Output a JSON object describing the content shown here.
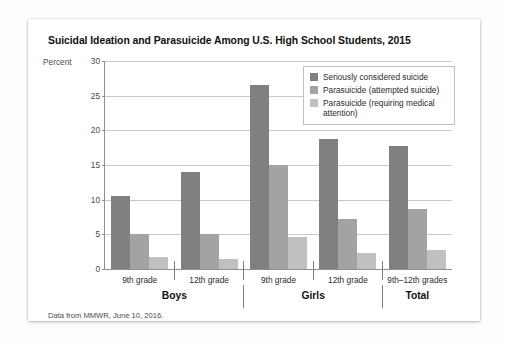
{
  "chart_data": {
    "type": "bar",
    "title": "Suicidal Ideation and Parasuicide Among U.S. High School Students, 2015",
    "ylabel": "Percent",
    "xlabel": "",
    "ylim": [
      0,
      30
    ],
    "yticks": [
      30,
      25,
      20,
      15,
      10,
      5,
      0
    ],
    "grid": true,
    "legend_position": "top-right",
    "categories": [
      "9th grade",
      "12th grade",
      "9th grade",
      "12th grade",
      "9th–12th grades"
    ],
    "supergroups": [
      {
        "label": "Boys",
        "span": 2
      },
      {
        "label": "Girls",
        "span": 2
      },
      {
        "label": "Total",
        "span": 1
      }
    ],
    "series": [
      {
        "name": "Seriously considered suicide",
        "color": "#808080",
        "values": [
          10.6,
          14.0,
          26.5,
          18.7,
          17.7
        ]
      },
      {
        "name": "Parasuicide (attempted suicide)",
        "color": "#a3a3a3",
        "values": [
          5.0,
          5.1,
          15.0,
          7.2,
          8.6
        ]
      },
      {
        "name": "Parasuicide (requiring medical attention)",
        "color": "#c0c0c0",
        "values": [
          1.8,
          1.4,
          4.6,
          2.3,
          2.8
        ]
      }
    ],
    "source_note": "Data from MMWR, June 10, 2016."
  }
}
